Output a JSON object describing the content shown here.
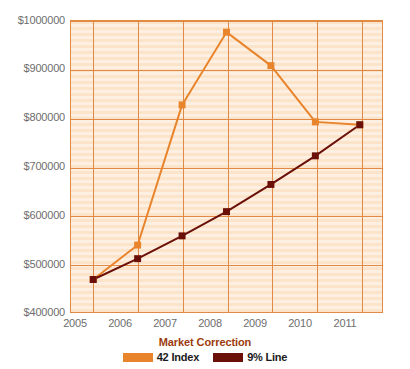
{
  "chart_data": {
    "type": "line",
    "title": "Market Correction",
    "xlabel": "",
    "ylabel": "",
    "x": [
      2005,
      2006,
      2007,
      2008,
      2009,
      2010,
      2011
    ],
    "categories": [
      "2005",
      "2006",
      "2007",
      "2008",
      "2009",
      "2010",
      "2011"
    ],
    "series": [
      {
        "name": "42 Index",
        "color": "#E8842C",
        "values": [
          467000,
          538000,
          827000,
          977000,
          908000,
          792000,
          786000
        ]
      },
      {
        "name": "9% Line",
        "color": "#6B1008",
        "values": [
          467000,
          510000,
          557000,
          607000,
          663000,
          722000,
          786000
        ]
      }
    ],
    "ylim": [
      400000,
      1000000
    ],
    "ytick_values": [
      400000,
      500000,
      600000,
      700000,
      800000,
      900000,
      1000000
    ],
    "ytick_labels": [
      "$400000",
      "$500000",
      "$600000",
      "$700000",
      "$800000",
      "$900000",
      "$1000000"
    ],
    "xtick_labels": [
      "2005",
      "2006",
      "2007",
      "2008",
      "2009",
      "2010",
      "2011"
    ],
    "grid": true,
    "legend_position": "bottom",
    "plot_background_color": "#FCE4CB",
    "grid_color": "#E08A45",
    "title_color": "#9C3B0E",
    "axis_label_color": "#6E6E6E"
  }
}
